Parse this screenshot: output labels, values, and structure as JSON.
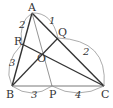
{
  "diagram": {
    "type": "geometry-triangle-cevians",
    "points": {
      "A": {
        "label": "A",
        "x": 32,
        "y": 13
      },
      "B": {
        "label": "B",
        "x": 12,
        "y": 86
      },
      "C": {
        "label": "C",
        "x": 104,
        "y": 86
      },
      "P": {
        "label": "P",
        "x": 52,
        "y": 86
      },
      "Q": {
        "label": "Q",
        "x": 58,
        "y": 38
      },
      "R": {
        "label": "R",
        "x": 22,
        "y": 44
      },
      "O": {
        "label": "O",
        "x": 44,
        "y": 52
      }
    },
    "segment_lengths": {
      "AR": "2",
      "RB": "3",
      "AQ": "1",
      "QC": "2",
      "BP": "3",
      "PC": "4"
    }
  }
}
